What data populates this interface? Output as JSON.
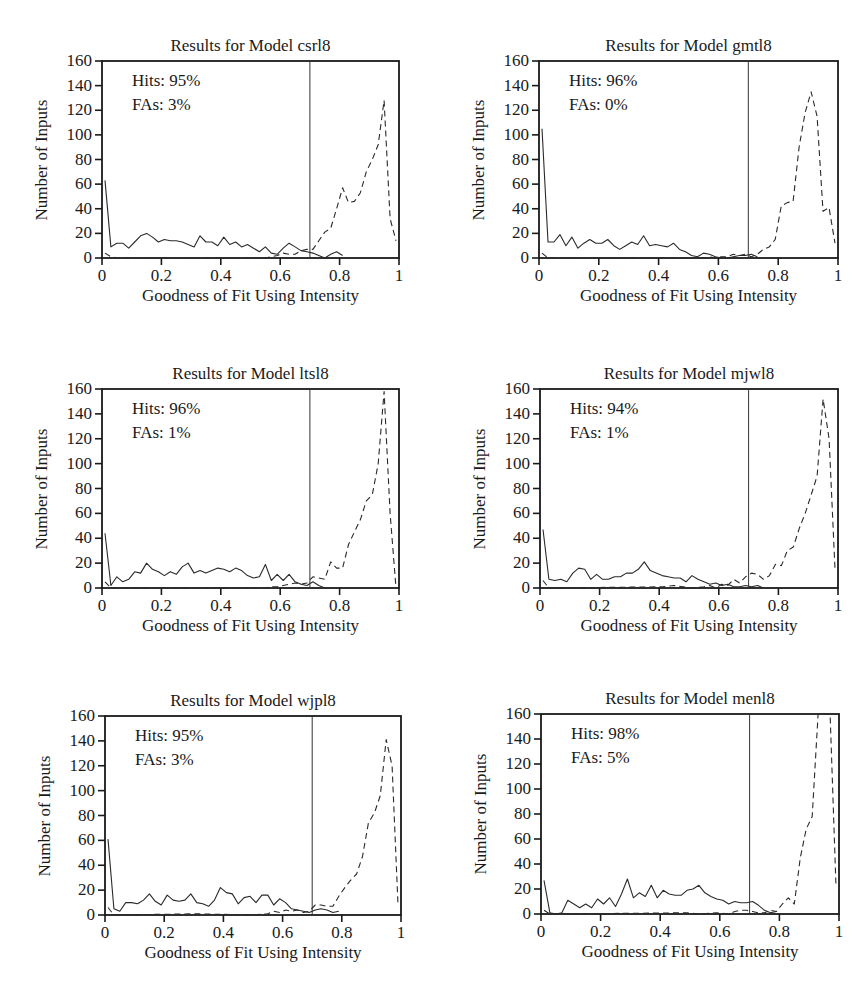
{
  "chart_data": [
    {
      "type": "line",
      "title": "Results for Model csrl8",
      "xlabel": "Goodness of Fit Using Intensity",
      "ylabel": "Number of Inputs",
      "xlim": [
        0,
        1
      ],
      "ylim": [
        0,
        160
      ],
      "xticks": [
        "0",
        "0.2",
        "0.4",
        "0.6",
        "0.8",
        "1"
      ],
      "yticks": [
        "0",
        "20",
        "40",
        "60",
        "80",
        "100",
        "120",
        "140",
        "160"
      ],
      "threshold": 0.7,
      "annotations": {
        "hits": "Hits: 95%",
        "fas": "FAs: 3%"
      },
      "series": [
        {
          "name": "solid",
          "style": "solid",
          "x": [
            0.01,
            0.03,
            0.05,
            0.07,
            0.09,
            0.11,
            0.13,
            0.15,
            0.17,
            0.19,
            0.21,
            0.23,
            0.25,
            0.27,
            0.29,
            0.31,
            0.33,
            0.35,
            0.37,
            0.39,
            0.41,
            0.43,
            0.45,
            0.47,
            0.49,
            0.51,
            0.53,
            0.55,
            0.57,
            0.59,
            0.61,
            0.63,
            0.65,
            0.67,
            0.69,
            0.71,
            0.73,
            0.75,
            0.77,
            0.79,
            0.81
          ],
          "y": [
            63,
            9,
            12,
            12,
            8,
            13,
            18,
            20,
            17,
            13,
            15,
            14,
            14,
            13,
            11,
            9,
            18,
            13,
            13,
            10,
            17,
            11,
            13,
            9,
            11,
            8,
            5,
            9,
            4,
            3,
            8,
            12,
            9,
            6,
            5,
            4,
            2,
            0,
            3,
            5,
            2
          ]
        },
        {
          "name": "dashed",
          "style": "dashed",
          "x": [
            0.01,
            0.03,
            0.05,
            0.55,
            0.57,
            0.59,
            0.61,
            0.63,
            0.65,
            0.67,
            0.69,
            0.71,
            0.73,
            0.75,
            0.77,
            0.79,
            0.81,
            0.83,
            0.85,
            0.87,
            0.89,
            0.91,
            0.93,
            0.95,
            0.97,
            0.99
          ],
          "y": [
            4,
            1,
            0,
            0,
            1,
            2,
            4,
            3,
            3,
            6,
            7,
            7,
            14,
            21,
            24,
            40,
            57,
            45,
            46,
            53,
            70,
            80,
            92,
            128,
            32,
            14
          ]
        }
      ]
    },
    {
      "type": "line",
      "title": "Results for Model gmtl8",
      "xlabel": "Goodness of Fit Using Intensity",
      "ylabel": "Number of Inputs",
      "xlim": [
        0,
        1
      ],
      "ylim": [
        0,
        160
      ],
      "xticks": [
        "0",
        "0.2",
        "0.4",
        "0.6",
        "0.8",
        "1"
      ],
      "yticks": [
        "0",
        "20",
        "40",
        "60",
        "80",
        "100",
        "120",
        "140",
        "160"
      ],
      "threshold": 0.7,
      "annotations": {
        "hits": "Hits: 96%",
        "fas": "FAs: 0%"
      },
      "series": [
        {
          "name": "solid",
          "style": "solid",
          "x": [
            0.01,
            0.03,
            0.05,
            0.07,
            0.09,
            0.11,
            0.13,
            0.15,
            0.17,
            0.19,
            0.21,
            0.23,
            0.25,
            0.27,
            0.29,
            0.31,
            0.33,
            0.35,
            0.37,
            0.39,
            0.41,
            0.43,
            0.45,
            0.47,
            0.49,
            0.51,
            0.53,
            0.55,
            0.57,
            0.59,
            0.61,
            0.63,
            0.65,
            0.67,
            0.69,
            0.71,
            0.73
          ],
          "y": [
            105,
            13,
            13,
            19,
            10,
            17,
            8,
            12,
            15,
            12,
            12,
            15,
            10,
            7,
            10,
            13,
            11,
            18,
            10,
            11,
            10,
            9,
            12,
            7,
            5,
            2,
            1,
            4,
            3,
            1,
            0,
            0,
            1,
            2,
            2,
            3,
            1
          ]
        },
        {
          "name": "dashed",
          "style": "dashed",
          "x": [
            0.01,
            0.03,
            0.55,
            0.57,
            0.59,
            0.61,
            0.63,
            0.65,
            0.67,
            0.69,
            0.71,
            0.73,
            0.75,
            0.77,
            0.79,
            0.81,
            0.83,
            0.85,
            0.87,
            0.89,
            0.91,
            0.93,
            0.95,
            0.97,
            0.99
          ],
          "y": [
            4,
            0,
            0,
            1,
            0,
            1,
            1,
            3,
            2,
            3,
            1,
            3,
            7,
            9,
            15,
            42,
            45,
            46,
            90,
            118,
            135,
            115,
            38,
            41,
            12
          ]
        }
      ]
    },
    {
      "type": "line",
      "title": "Results for Model ltsl8",
      "xlabel": "Goodness of Fit Using Intensity",
      "ylabel": "Number of Inputs",
      "xlim": [
        0,
        1
      ],
      "ylim": [
        0,
        160
      ],
      "xticks": [
        "0",
        "0.2",
        "0.4",
        "0.6",
        "0.8",
        "1"
      ],
      "yticks": [
        "0",
        "20",
        "40",
        "60",
        "80",
        "100",
        "120",
        "140",
        "160"
      ],
      "threshold": 0.7,
      "annotations": {
        "hits": "Hits: 96%",
        "fas": "FAs: 1%"
      },
      "series": [
        {
          "name": "solid",
          "style": "solid",
          "x": [
            0.01,
            0.03,
            0.05,
            0.07,
            0.09,
            0.11,
            0.13,
            0.15,
            0.17,
            0.19,
            0.21,
            0.23,
            0.25,
            0.27,
            0.29,
            0.31,
            0.33,
            0.35,
            0.37,
            0.39,
            0.41,
            0.43,
            0.45,
            0.47,
            0.49,
            0.51,
            0.53,
            0.55,
            0.57,
            0.59,
            0.61,
            0.63,
            0.65,
            0.67,
            0.69,
            0.71,
            0.73,
            0.75
          ],
          "y": [
            44,
            2,
            9,
            5,
            7,
            13,
            12,
            20,
            15,
            13,
            10,
            13,
            11,
            17,
            20,
            12,
            14,
            12,
            14,
            16,
            15,
            13,
            16,
            14,
            10,
            8,
            9,
            19,
            6,
            11,
            6,
            11,
            5,
            3,
            2,
            5,
            2,
            0
          ]
        },
        {
          "name": "dashed",
          "style": "dashed",
          "x": [
            0.01,
            0.03,
            0.55,
            0.57,
            0.59,
            0.61,
            0.63,
            0.65,
            0.67,
            0.69,
            0.71,
            0.73,
            0.75,
            0.77,
            0.79,
            0.81,
            0.83,
            0.85,
            0.87,
            0.89,
            0.91,
            0.93,
            0.95,
            0.97,
            0.99
          ],
          "y": [
            5,
            0,
            0,
            1,
            1,
            2,
            3,
            4,
            3,
            4,
            9,
            8,
            7,
            21,
            16,
            16,
            35,
            45,
            55,
            70,
            75,
            100,
            158,
            60,
            0
          ]
        }
      ]
    },
    {
      "type": "line",
      "title": "Results for Model mjwl8",
      "xlabel": "Goodness of Fit Using Intensity",
      "ylabel": "Number of Inputs",
      "xlim": [
        0,
        1
      ],
      "ylim": [
        0,
        160
      ],
      "xticks": [
        "0",
        "0.2",
        "0.4",
        "0.6",
        "0.8",
        "1"
      ],
      "yticks": [
        "0",
        "20",
        "40",
        "60",
        "80",
        "100",
        "120",
        "140",
        "160"
      ],
      "threshold": 0.7,
      "annotations": {
        "hits": "Hits: 94%",
        "fas": "FAs: 1%"
      },
      "series": [
        {
          "name": "solid",
          "style": "solid",
          "x": [
            0.01,
            0.03,
            0.05,
            0.07,
            0.09,
            0.11,
            0.13,
            0.15,
            0.17,
            0.19,
            0.21,
            0.23,
            0.25,
            0.27,
            0.29,
            0.31,
            0.33,
            0.35,
            0.37,
            0.39,
            0.41,
            0.43,
            0.45,
            0.47,
            0.49,
            0.51,
            0.53,
            0.55,
            0.57,
            0.59,
            0.61,
            0.63,
            0.65,
            0.67,
            0.69,
            0.71,
            0.73,
            0.75
          ],
          "y": [
            47,
            7,
            6,
            7,
            5,
            12,
            16,
            15,
            7,
            11,
            7,
            7,
            9,
            9,
            12,
            12,
            15,
            21,
            14,
            12,
            10,
            9,
            8,
            8,
            5,
            10,
            7,
            5,
            3,
            4,
            2,
            3,
            1,
            1,
            2,
            1,
            2,
            0
          ]
        },
        {
          "name": "dashed",
          "style": "dashed",
          "x": [
            0.01,
            0.03,
            0.41,
            0.45,
            0.51,
            0.55,
            0.57,
            0.59,
            0.61,
            0.63,
            0.65,
            0.67,
            0.69,
            0.71,
            0.73,
            0.75,
            0.77,
            0.79,
            0.81,
            0.83,
            0.85,
            0.87,
            0.89,
            0.91,
            0.93,
            0.95,
            0.97,
            0.99
          ],
          "y": [
            6,
            0,
            1,
            2,
            0,
            1,
            2,
            0,
            3,
            2,
            7,
            4,
            9,
            12,
            11,
            7,
            10,
            19,
            18,
            30,
            33,
            48,
            60,
            75,
            90,
            152,
            120,
            15
          ]
        }
      ]
    },
    {
      "type": "line",
      "title": "Results for Model wjpl8",
      "xlabel": "Goodness of Fit Using Intensity",
      "ylabel": "Number of Inputs",
      "xlim": [
        0,
        1
      ],
      "ylim": [
        0,
        160
      ],
      "xticks": [
        "0",
        "0.2",
        "0.4",
        "0.6",
        "0.8",
        "1"
      ],
      "yticks": [
        "0",
        "20",
        "40",
        "60",
        "80",
        "100",
        "120",
        "140",
        "160"
      ],
      "threshold": 0.7,
      "annotations": {
        "hits": "Hits: 95%",
        "fas": "FAs: 3%"
      },
      "series": [
        {
          "name": "solid",
          "style": "solid",
          "x": [
            0.01,
            0.03,
            0.05,
            0.07,
            0.09,
            0.11,
            0.13,
            0.15,
            0.17,
            0.19,
            0.21,
            0.23,
            0.25,
            0.27,
            0.29,
            0.31,
            0.33,
            0.35,
            0.37,
            0.39,
            0.41,
            0.43,
            0.45,
            0.47,
            0.49,
            0.51,
            0.53,
            0.55,
            0.57,
            0.59,
            0.61,
            0.63,
            0.65,
            0.67,
            0.69,
            0.71,
            0.73,
            0.75,
            0.77,
            0.79
          ],
          "y": [
            61,
            5,
            3,
            10,
            10,
            9,
            12,
            17,
            11,
            8,
            16,
            12,
            11,
            12,
            17,
            10,
            9,
            7,
            12,
            22,
            18,
            17,
            9,
            14,
            15,
            10,
            16,
            16,
            8,
            13,
            10,
            5,
            4,
            3,
            2,
            4,
            5,
            4,
            2,
            3
          ]
        },
        {
          "name": "dashed",
          "style": "dashed",
          "x": [
            0.01,
            0.03,
            0.31,
            0.49,
            0.55,
            0.57,
            0.59,
            0.61,
            0.63,
            0.65,
            0.67,
            0.69,
            0.71,
            0.73,
            0.75,
            0.77,
            0.79,
            0.81,
            0.83,
            0.85,
            0.87,
            0.89,
            0.91,
            0.93,
            0.95,
            0.97,
            0.99
          ],
          "y": [
            6,
            0,
            1,
            0,
            1,
            3,
            2,
            4,
            3,
            4,
            2,
            3,
            8,
            8,
            7,
            7,
            15,
            22,
            28,
            33,
            47,
            74,
            82,
            96,
            141,
            120,
            8
          ]
        }
      ]
    },
    {
      "type": "line",
      "title": "Results for Model menl8",
      "xlabel": "Goodness of Fit Using Intensity",
      "ylabel": "Number of Inputs",
      "xlim": [
        0,
        1
      ],
      "ylim": [
        0,
        160
      ],
      "xticks": [
        "0",
        "0.2",
        "0.4",
        "0.6",
        "0.8",
        "1"
      ],
      "yticks": [
        "0",
        "20",
        "40",
        "60",
        "80",
        "100",
        "120",
        "140",
        "160"
      ],
      "threshold": 0.7,
      "annotations": {
        "hits": "Hits: 98%",
        "fas": "FAs: 5%"
      },
      "series": [
        {
          "name": "solid",
          "style": "solid",
          "x": [
            0.01,
            0.03,
            0.05,
            0.07,
            0.09,
            0.11,
            0.13,
            0.15,
            0.17,
            0.19,
            0.21,
            0.23,
            0.25,
            0.27,
            0.29,
            0.31,
            0.33,
            0.35,
            0.37,
            0.39,
            0.41,
            0.43,
            0.45,
            0.47,
            0.49,
            0.51,
            0.53,
            0.55,
            0.57,
            0.59,
            0.61,
            0.63,
            0.65,
            0.67,
            0.69,
            0.71,
            0.73,
            0.75,
            0.77,
            0.79
          ],
          "y": [
            27,
            1,
            0,
            1,
            11,
            8,
            5,
            8,
            5,
            12,
            8,
            13,
            6,
            16,
            28,
            13,
            17,
            14,
            23,
            13,
            19,
            16,
            15,
            15,
            19,
            20,
            23,
            17,
            14,
            12,
            11,
            8,
            10,
            9,
            9,
            10,
            7,
            3,
            1,
            2
          ]
        },
        {
          "name": "dashed",
          "style": "dashed",
          "x": [
            0.01,
            0.03,
            0.49,
            0.53,
            0.59,
            0.63,
            0.65,
            0.67,
            0.69,
            0.71,
            0.73,
            0.75,
            0.77,
            0.79,
            0.81,
            0.83,
            0.85,
            0.87,
            0.89,
            0.91,
            0.93,
            0.95,
            0.97,
            0.99
          ],
          "y": [
            3,
            0,
            1,
            0,
            1,
            0,
            2,
            3,
            3,
            2,
            1,
            1,
            3,
            2,
            8,
            13,
            8,
            45,
            68,
            78,
            160,
            160,
            160,
            22
          ]
        }
      ]
    }
  ]
}
